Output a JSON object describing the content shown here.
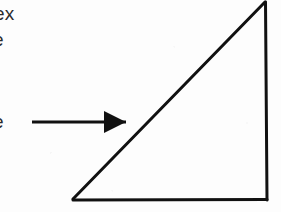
{
  "figure": {
    "background_color": "#fdfdfd",
    "ink_color": "#111111",
    "canvas": {
      "width": 281,
      "height": 212
    },
    "margin_text": {
      "line_1": "ex",
      "line_2": "e",
      "line_3": "e"
    },
    "triangle": {
      "name": "right-triangle",
      "stroke_color": "#111111",
      "stroke_width": 3,
      "fill": "none",
      "vertices": {
        "apex_top_right": {
          "x": 265,
          "y": 2
        },
        "bottom_left": {
          "x": 73,
          "y": 199
        },
        "bottom_right": {
          "x": 267,
          "y": 199
        }
      },
      "edges": [
        {
          "name": "hypotenuse",
          "from": "bottom_left",
          "to": "apex_top_right"
        },
        {
          "name": "vertical-right-side",
          "from": "apex_top_right",
          "to": "bottom_right"
        },
        {
          "name": "horizontal-base",
          "from": "bottom_right",
          "to": "bottom_left"
        }
      ]
    },
    "arrow": {
      "name": "pointer-arrow",
      "stroke_color": "#111111",
      "stroke_width": 3,
      "direction": "right",
      "tail": {
        "x": 32,
        "y": 122
      },
      "tip": {
        "x": 126,
        "y": 122
      },
      "head": {
        "shape": "solid-triangle",
        "length": 22,
        "half_height": 11
      },
      "points_at": "hypotenuse"
    }
  }
}
